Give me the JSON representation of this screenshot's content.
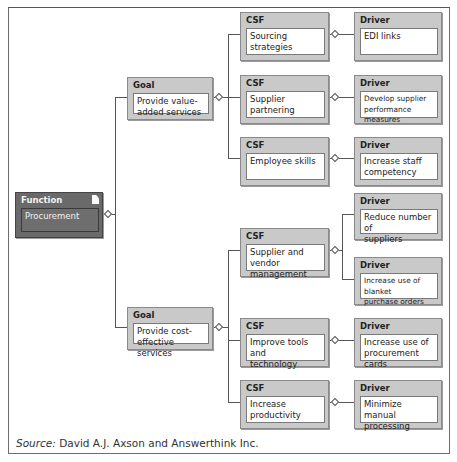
{
  "diagram": {
    "function": {
      "header": "Function",
      "label": "Procurement",
      "icon": "document-icon"
    },
    "goals": [
      {
        "header": "Goal",
        "label": "Provide value-added services",
        "csfs": [
          {
            "header": "CSF",
            "label": "Sourcing strategies",
            "drivers": [
              {
                "header": "Driver",
                "label": "EDI links"
              }
            ]
          },
          {
            "header": "CSF",
            "label": "Supplier partnering",
            "drivers": [
              {
                "header": "Driver",
                "label": "Develop supplier performance measures"
              }
            ]
          },
          {
            "header": "CSF",
            "label": "Employee skills",
            "drivers": [
              {
                "header": "Driver",
                "label": "Increase staff competency"
              }
            ]
          }
        ]
      },
      {
        "header": "Goal",
        "label": "Provide cost-effective services",
        "csfs": [
          {
            "header": "CSF",
            "label": "Supplier and vendor management",
            "drivers": [
              {
                "header": "Driver",
                "label": "Reduce number of suppliers"
              },
              {
                "header": "Driver",
                "label": "Increase use of blanket purchase orders"
              }
            ]
          },
          {
            "header": "CSF",
            "label": "Improve tools and technology",
            "drivers": [
              {
                "header": "Driver",
                "label": "Increase use of procurement cards"
              }
            ]
          },
          {
            "header": "CSF",
            "label": "Increase productivity",
            "drivers": [
              {
                "header": "Driver",
                "label": "Minimize manual processing"
              }
            ]
          }
        ]
      }
    ]
  },
  "display": {
    "goal1_line1": "Provide value-",
    "goal1_line2": "added services",
    "goal2_line1": "Provide cost-",
    "goal2_line2": "effective services",
    "csf4_line1": "Supplier and vendor",
    "csf4_line2": "management",
    "csf5_line1": "Improve tools and",
    "csf5_line2": "technology",
    "csf6_line1": "Increase",
    "csf6_line2": "productivity",
    "d2_line1": "Develop supplier",
    "d2_line2": "performance measures",
    "d3_line1": "Increase staff",
    "d3_line2": "competency",
    "d4_line1": "Reduce number of",
    "d4_line2": "suppliers",
    "d5_line1": "Increase use of blanket",
    "d5_line2": "purchase orders",
    "d6_line1": "Increase use of",
    "d6_line2": "procurement cards",
    "d7_line1": "Minimize manual",
    "d7_line2": "processing"
  },
  "footer": {
    "source_label": "Source:",
    "source_text": " David A.J. Axson and Answerthink Inc."
  },
  "colors": {
    "node_header_bg": "#c9c9c9",
    "function_bg": "#6a6a6a",
    "line": "#555555"
  }
}
